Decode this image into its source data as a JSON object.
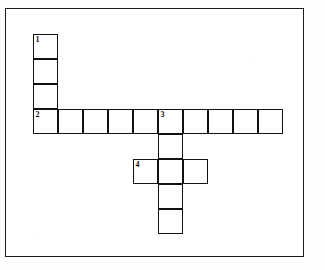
{
  "page": {
    "background_color": "#fdfdfc",
    "frame_color": "#1a1a1a",
    "cell_border_color": "#111111",
    "cell_fill_color": "#ffffff"
  },
  "grid": {
    "cell_size": 25,
    "origin_x": 32,
    "origin_y": 33,
    "columns": 10,
    "rows": 8
  },
  "clue_numbers": {
    "one": "1",
    "two": "2",
    "three": "3",
    "four": "4"
  },
  "entries": [
    {
      "number": "1",
      "direction": "down",
      "length": 4,
      "start_col": 0,
      "start_row": 0,
      "letters": [
        "",
        "",
        "",
        ""
      ]
    },
    {
      "number": "2",
      "direction": "across",
      "length": 10,
      "start_col": 0,
      "start_row": 3,
      "letters": [
        "",
        "",
        "",
        "",
        "",
        "",
        "",
        "",
        "",
        ""
      ]
    },
    {
      "number": "3",
      "direction": "down",
      "length": 5,
      "start_col": 5,
      "start_row": 3,
      "letters": [
        "",
        "",
        "",
        "",
        ""
      ]
    },
    {
      "number": "4",
      "direction": "across",
      "length": 3,
      "start_col": 4,
      "start_row": 5,
      "letters": [
        "",
        "",
        ""
      ]
    }
  ],
  "cells": [
    {
      "name": "cell-1-down-1",
      "number": "1",
      "letter": "",
      "x": 32,
      "y": 33,
      "w": 25,
      "h": 25
    },
    {
      "name": "cell-1-down-2",
      "number": "",
      "letter": "",
      "x": 32,
      "y": 58,
      "w": 25,
      "h": 25
    },
    {
      "name": "cell-1-down-3",
      "number": "",
      "letter": "",
      "x": 32,
      "y": 83,
      "w": 25,
      "h": 25
    },
    {
      "name": "cell-2-across-1",
      "number": "2",
      "letter": "",
      "x": 32,
      "y": 108,
      "w": 25,
      "h": 25
    },
    {
      "name": "cell-2-across-2",
      "number": "",
      "letter": "",
      "x": 57,
      "y": 108,
      "w": 25,
      "h": 25
    },
    {
      "name": "cell-2-across-3",
      "number": "",
      "letter": "",
      "x": 82,
      "y": 108,
      "w": 25,
      "h": 25
    },
    {
      "name": "cell-2-across-4",
      "number": "",
      "letter": "",
      "x": 107,
      "y": 108,
      "w": 25,
      "h": 25
    },
    {
      "name": "cell-2-across-5",
      "number": "",
      "letter": "",
      "x": 132,
      "y": 108,
      "w": 25,
      "h": 25
    },
    {
      "name": "cell-2-across-6",
      "number": "3",
      "letter": "",
      "x": 157,
      "y": 108,
      "w": 25,
      "h": 25
    },
    {
      "name": "cell-2-across-7",
      "number": "",
      "letter": "",
      "x": 182,
      "y": 108,
      "w": 25,
      "h": 25
    },
    {
      "name": "cell-2-across-8",
      "number": "",
      "letter": "",
      "x": 207,
      "y": 108,
      "w": 25,
      "h": 25
    },
    {
      "name": "cell-2-across-9",
      "number": "",
      "letter": "",
      "x": 232,
      "y": 108,
      "w": 25,
      "h": 25
    },
    {
      "name": "cell-2-across-10",
      "number": "",
      "letter": "",
      "x": 257,
      "y": 108,
      "w": 25,
      "h": 25
    },
    {
      "name": "cell-3-down-2",
      "number": "",
      "letter": "",
      "x": 157,
      "y": 133,
      "w": 25,
      "h": 25
    },
    {
      "name": "cell-3-down-3",
      "number": "",
      "letter": "",
      "x": 157,
      "y": 158,
      "w": 25,
      "h": 25
    },
    {
      "name": "cell-3-down-4",
      "number": "",
      "letter": "",
      "x": 157,
      "y": 183,
      "w": 25,
      "h": 25
    },
    {
      "name": "cell-3-down-5",
      "number": "",
      "letter": "",
      "x": 157,
      "y": 208,
      "w": 25,
      "h": 25
    },
    {
      "name": "cell-4-across-1",
      "number": "4",
      "letter": "",
      "x": 132,
      "y": 158,
      "w": 25,
      "h": 25
    },
    {
      "name": "cell-4-across-3",
      "number": "",
      "letter": "",
      "x": 182,
      "y": 158,
      "w": 25,
      "h": 25
    }
  ]
}
